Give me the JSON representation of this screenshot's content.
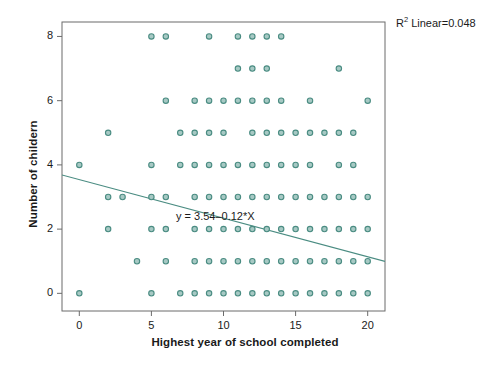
{
  "chart_data": {
    "type": "scatter",
    "title": "",
    "xlabel": "Highest year of school completed",
    "ylabel": "Number of childern",
    "xlim": [
      -1.2,
      21.2
    ],
    "ylim": [
      -0.55,
      8.45
    ],
    "xticks": [
      0,
      5,
      10,
      15,
      20
    ],
    "xtick_labels": [
      "0",
      "5",
      "10",
      "15",
      "20"
    ],
    "yticks": [
      0,
      2,
      4,
      6,
      8
    ],
    "ytick_labels": [
      "0",
      "2",
      "4",
      "6",
      "8"
    ],
    "grid": false,
    "legend": null,
    "marker": {
      "shape": "circle-open",
      "fill": "#a7c9c4",
      "stroke": "#4a8c82",
      "size": 5.4
    },
    "annotations": [
      {
        "name": "r-squared",
        "text": "R² Linear=0.048",
        "x_px": 396,
        "y_px": 17
      },
      {
        "name": "regression-equation",
        "text": "y = 3.54–0.12*X",
        "x_px": 176,
        "y_px": 210
      }
    ],
    "r_squared_label": "R",
    "r_squared_sup": "2",
    "r_squared_value": " Linear=0.048",
    "equation": "y = 3.54–0.12*X",
    "fit_line": {
      "type": "linear",
      "intercept": 3.54,
      "slope": -0.12,
      "color": "#4a8c82",
      "x_start": -1.2,
      "x_end": 21.2
    },
    "points": [
      {
        "y": 8,
        "x": [
          5,
          6,
          9,
          11,
          12,
          13,
          14
        ]
      },
      {
        "y": 7,
        "x": [
          11,
          12,
          13,
          18
        ]
      },
      {
        "y": 6,
        "x": [
          6,
          8,
          9,
          10,
          11,
          12,
          13,
          14,
          16,
          20
        ]
      },
      {
        "y": 5,
        "x": [
          2,
          7,
          8,
          9,
          10,
          12,
          13,
          14,
          15,
          16,
          17,
          18,
          19
        ]
      },
      {
        "y": 4,
        "x": [
          0,
          5,
          7,
          8,
          9,
          10,
          11,
          12,
          13,
          14,
          15,
          16,
          18,
          19
        ]
      },
      {
        "y": 3,
        "x": [
          2,
          3,
          5,
          6,
          8,
          9,
          10,
          11,
          12,
          13,
          14,
          15,
          16,
          17,
          18,
          19,
          20
        ]
      },
      {
        "y": 2,
        "x": [
          2,
          5,
          6,
          8,
          9,
          10,
          11,
          12,
          13,
          14,
          15,
          16,
          17,
          18,
          19,
          20
        ]
      },
      {
        "y": 1,
        "x": [
          4,
          6,
          8,
          9,
          10,
          11,
          12,
          13,
          14,
          15,
          16,
          17,
          18,
          19,
          20
        ]
      },
      {
        "y": 0,
        "x": [
          0,
          5,
          7,
          8,
          9,
          10,
          11,
          12,
          13,
          14,
          15,
          16,
          17,
          18,
          19,
          20
        ]
      }
    ]
  },
  "axes": {
    "frame_color": "#6b6b6b",
    "background": "#ffffff"
  }
}
